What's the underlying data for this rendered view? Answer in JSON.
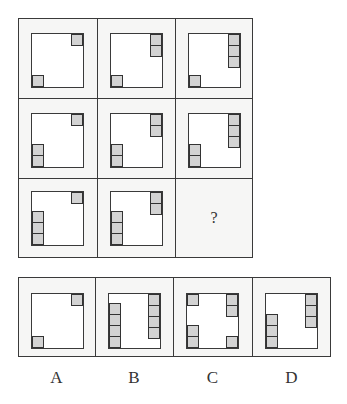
{
  "puzzle": {
    "matrix": [
      {
        "row": 1,
        "col": 1,
        "top_right_stack": 1,
        "bottom_left_stack": 1
      },
      {
        "row": 1,
        "col": 2,
        "top_right_stack": 2,
        "bottom_left_stack": 1
      },
      {
        "row": 1,
        "col": 3,
        "top_right_stack": 3,
        "bottom_left_stack": 1
      },
      {
        "row": 2,
        "col": 1,
        "top_right_stack": 1,
        "bottom_left_stack": 2
      },
      {
        "row": 2,
        "col": 2,
        "top_right_stack": 2,
        "bottom_left_stack": 2
      },
      {
        "row": 2,
        "col": 3,
        "top_right_stack": 3,
        "bottom_left_stack": 2
      },
      {
        "row": 3,
        "col": 1,
        "top_right_stack": 1,
        "bottom_left_stack": 3
      },
      {
        "row": 3,
        "col": 2,
        "top_right_stack": 2,
        "bottom_left_stack": 3
      },
      {
        "row": 3,
        "col": 3,
        "missing": true,
        "text": "?"
      }
    ],
    "question_mark": "?",
    "options": [
      {
        "label": "A",
        "description": "top-right 1, bottom-left 1"
      },
      {
        "label": "B",
        "description": "left column 4 (bottom-aligned), right column 4 (top-aligned)"
      },
      {
        "label": "C",
        "description": "top-left 1, top-right 2, bottom-left 2, bottom-right 1"
      },
      {
        "label": "D",
        "description": "top-right 3, bottom-left 3"
      }
    ],
    "colors": {
      "line": "#3a3a3a",
      "block_fill": "#d3d3d3",
      "cell_bg": "#f6f6f5",
      "inner_bg": "#ffffff"
    }
  }
}
